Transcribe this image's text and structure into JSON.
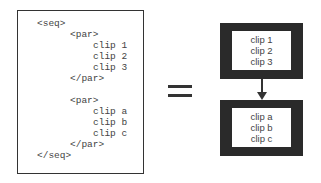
{
  "code": {
    "lines": [
      {
        "text": "<seq>",
        "indent": 0
      },
      {
        "text": "<par>",
        "indent": 1
      },
      {
        "text": "clip 1",
        "indent": 2
      },
      {
        "text": "clip 2",
        "indent": 2
      },
      {
        "text": "clip 3",
        "indent": 2
      },
      {
        "text": "</par>",
        "indent": 1
      },
      {
        "text": "<par>",
        "indent": 1
      },
      {
        "text": "clip a",
        "indent": 2
      },
      {
        "text": "clip b",
        "indent": 2
      },
      {
        "text": "clip c",
        "indent": 2
      },
      {
        "text": "</par>",
        "indent": 1
      },
      {
        "text": "</seq>",
        "indent": 0
      }
    ]
  },
  "diagram": {
    "equals_symbol": "=",
    "blocks": [
      {
        "clips": [
          "clip 1",
          "clip 2",
          "clip 3"
        ]
      },
      {
        "clips": [
          "clip a",
          "clip b",
          "clip c"
        ]
      }
    ],
    "arrow": "down"
  }
}
